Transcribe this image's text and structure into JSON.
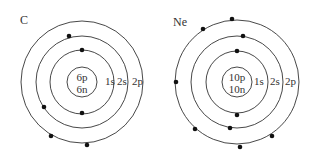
{
  "atoms": [
    {
      "symbol": "C",
      "nucleus": [
        "6p",
        "6n"
      ],
      "shell_labels": [
        "1s",
        "2s",
        "2p"
      ],
      "electrons_per_shell": [
        2,
        2,
        2
      ]
    },
    {
      "symbol": "Ne",
      "nucleus": [
        "10p",
        "10n"
      ],
      "shell_labels": [
        "1s",
        "2s",
        "2p"
      ],
      "electrons_per_shell": [
        2,
        2,
        6
      ]
    }
  ]
}
